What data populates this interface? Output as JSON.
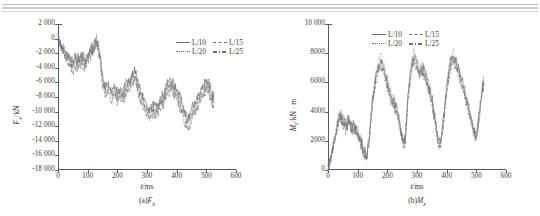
{
  "figure": {
    "panels": [
      {
        "id": "panel-a",
        "caption_prefix": "(a)",
        "caption_symbol": "F",
        "caption_sub": "x",
        "xlabel_var": "t",
        "xlabel_unit": "/ms",
        "ylabel_var": "F",
        "ylabel_sub": "x",
        "ylabel_unit": "/kN",
        "legend": [
          "L/10",
          "L/15",
          "L/20",
          "L/25"
        ]
      },
      {
        "id": "panel-b",
        "caption_prefix": "(b)",
        "caption_symbol": "M",
        "caption_sub": "z",
        "xlabel_var": "t",
        "xlabel_unit": "/ms",
        "ylabel_var": "M",
        "ylabel_sub": "z",
        "ylabel_unit": "/kN · m",
        "legend": [
          "L/10",
          "L/15",
          "L/20",
          "L/25"
        ]
      }
    ]
  },
  "chart_data": [
    {
      "type": "line",
      "id": "panel-a",
      "title": "(a)Fx",
      "xlabel": "t/ms",
      "ylabel": "Fx/kN",
      "xlim": [
        0,
        600
      ],
      "ylim": [
        -18000,
        2000
      ],
      "xticks": [
        0,
        100,
        200,
        300,
        400,
        500,
        600
      ],
      "yticks": [
        2000,
        0,
        -2000,
        -4000,
        -6000,
        -8000,
        -10000,
        -12000,
        -14000,
        -16000,
        -18000
      ],
      "ytick_labels": [
        "2 000",
        "0",
        "-2 000",
        "-4 000",
        "-6 000",
        "-8 000",
        "-10 000",
        "-12 000",
        "-14 000",
        "-16 000",
        "-18 000"
      ],
      "xtick_labels": [
        "0",
        "100",
        "200",
        "300",
        "400",
        "500",
        "600"
      ],
      "grid": false,
      "legend": [
        "L/10",
        "L/15",
        "L/20",
        "L/25"
      ],
      "legend_position": "top-right",
      "x": [
        0,
        10,
        20,
        30,
        40,
        50,
        60,
        70,
        80,
        90,
        100,
        110,
        120,
        130,
        140,
        150,
        160,
        170,
        180,
        190,
        200,
        210,
        220,
        230,
        240,
        250,
        260,
        270,
        280,
        290,
        300,
        310,
        320,
        330,
        340,
        350,
        360,
        370,
        380,
        390,
        400,
        410,
        420,
        430,
        440,
        450,
        460,
        470,
        480,
        490,
        500,
        510,
        520,
        525
      ],
      "series": [
        {
          "name": "L/10",
          "style": "solid",
          "values": [
            0,
            -900,
            -1700,
            -2200,
            -2600,
            -3100,
            -2500,
            -3000,
            -2400,
            -2900,
            -2300,
            -1600,
            -900,
            -300,
            -1500,
            -5200,
            -6600,
            -6000,
            -7200,
            -6500,
            -7400,
            -6700,
            -7300,
            -6200,
            -5800,
            -5000,
            -4700,
            -6100,
            -7400,
            -8400,
            -9200,
            -9700,
            -9000,
            -9500,
            -8600,
            -8000,
            -7400,
            -6200,
            -5700,
            -6400,
            -7000,
            -7800,
            -8900,
            -10400,
            -11000,
            -9800,
            -9000,
            -8200,
            -7400,
            -6500,
            -5500,
            -6400,
            -8100,
            -7300
          ]
        },
        {
          "name": "L/15",
          "style": "dash",
          "values": [
            0,
            -800,
            -1500,
            -2400,
            -2900,
            -3400,
            -2800,
            -3300,
            -2600,
            -3100,
            -2500,
            -1800,
            -1100,
            -200,
            -1800,
            -5600,
            -7000,
            -6400,
            -7600,
            -6900,
            -7800,
            -7100,
            -7700,
            -6600,
            -6200,
            -5400,
            -4500,
            -6500,
            -7800,
            -8800,
            -9600,
            -10100,
            -9400,
            -9900,
            -9000,
            -8400,
            -7800,
            -6600,
            -6100,
            -6800,
            -7400,
            -8200,
            -9300,
            -10800,
            -11400,
            -10200,
            -9400,
            -8600,
            -7800,
            -6900,
            -5900,
            -6800,
            -8500,
            -7700
          ]
        },
        {
          "name": "L/20",
          "style": "dot",
          "values": [
            0,
            -1000,
            -1900,
            -2600,
            -3200,
            -3800,
            -3300,
            -3700,
            -3000,
            -3500,
            -2900,
            -2100,
            -1300,
            -500,
            -2000,
            -6000,
            -7400,
            -6800,
            -8000,
            -7300,
            -8200,
            -7500,
            -8100,
            -7000,
            -6600,
            -5800,
            -5000,
            -6900,
            -8200,
            -9200,
            -10000,
            -10600,
            -9800,
            -10300,
            -9400,
            -8800,
            -8200,
            -7000,
            -6500,
            -7200,
            -7800,
            -8700,
            -9800,
            -11300,
            -11900,
            -10600,
            -9800,
            -9000,
            -8200,
            -7300,
            -6300,
            -7200,
            -9000,
            -8100
          ]
        },
        {
          "name": "L/25",
          "style": "dashdot",
          "values": [
            0,
            -1100,
            -2100,
            -2900,
            -3600,
            -4300,
            -3700,
            -4100,
            -3400,
            -3900,
            -3300,
            -2400,
            -1500,
            -600,
            -2300,
            -6400,
            -7800,
            -7200,
            -8400,
            -7700,
            -8600,
            -7900,
            -8500,
            -7400,
            -7000,
            -6200,
            -5400,
            -7300,
            -8600,
            -9700,
            -10500,
            -11100,
            -10300,
            -10800,
            -9900,
            -9200,
            -8600,
            -7400,
            -6900,
            -7600,
            -8300,
            -9200,
            -10300,
            -11900,
            -12500,
            -11200,
            -10300,
            -9400,
            -8600,
            -7700,
            -6700,
            -7600,
            -9500,
            -8600
          ]
        }
      ]
    },
    {
      "type": "line",
      "id": "panel-b",
      "title": "(b)Mz",
      "xlabel": "t/ms",
      "ylabel": "Mz/kN · m",
      "xlim": [
        0,
        600
      ],
      "ylim": [
        0,
        10000
      ],
      "xticks": [
        0,
        100,
        200,
        300,
        400,
        500,
        600
      ],
      "yticks": [
        0,
        2000,
        4000,
        6000,
        8000,
        10000
      ],
      "ytick_labels": [
        "0",
        "2000",
        "4000",
        "6000",
        "8000",
        "10 000"
      ],
      "xtick_labels": [
        "0",
        "100",
        "200",
        "300",
        "400",
        "500",
        "600"
      ],
      "grid": false,
      "legend": [
        "L/10",
        "L/15",
        "L/20",
        "L/25"
      ],
      "legend_position": "top-left",
      "x": [
        0,
        10,
        20,
        30,
        40,
        50,
        60,
        70,
        80,
        90,
        100,
        110,
        120,
        130,
        140,
        150,
        160,
        170,
        180,
        190,
        200,
        210,
        220,
        230,
        240,
        250,
        260,
        270,
        280,
        290,
        300,
        310,
        320,
        330,
        340,
        350,
        360,
        370,
        380,
        390,
        400,
        410,
        420,
        430,
        440,
        450,
        460,
        470,
        480,
        490,
        500,
        510,
        520,
        525
      ],
      "series": [
        {
          "name": "L/10",
          "style": "solid",
          "values": [
            100,
            900,
            1900,
            3000,
            3900,
            3500,
            3100,
            3400,
            2900,
            3100,
            2500,
            2000,
            1400,
            900,
            2500,
            4800,
            6300,
            7200,
            7600,
            6800,
            6000,
            5200,
            4700,
            4300,
            3500,
            2200,
            1900,
            5200,
            7000,
            7800,
            7300,
            6700,
            7100,
            6400,
            5800,
            4900,
            3600,
            2000,
            1900,
            3600,
            5600,
            7200,
            7900,
            7500,
            6900,
            6100,
            5400,
            4600,
            3700,
            2800,
            2400,
            3800,
            5600,
            6200
          ]
        },
        {
          "name": "L/15",
          "style": "dash",
          "values": [
            80,
            850,
            1800,
            2850,
            3700,
            3300,
            2950,
            3250,
            2750,
            2950,
            2350,
            1850,
            1300,
            800,
            2350,
            4600,
            6050,
            6950,
            7350,
            6550,
            5800,
            5000,
            4500,
            4100,
            3300,
            2050,
            1800,
            5000,
            6800,
            7550,
            7050,
            6450,
            6850,
            6150,
            5550,
            4700,
            3450,
            1900,
            1800,
            3450,
            5400,
            6950,
            7650,
            7250,
            6650,
            5900,
            5200,
            4450,
            3550,
            2700,
            2300,
            3650,
            5400,
            6000
          ]
        },
        {
          "name": "L/20",
          "style": "dot",
          "values": [
            90,
            950,
            2000,
            3150,
            4050,
            3650,
            3250,
            3550,
            3050,
            3250,
            2650,
            2100,
            1500,
            950,
            2650,
            5000,
            6500,
            7450,
            7850,
            7000,
            6200,
            5400,
            4900,
            4450,
            3650,
            2300,
            2000,
            5400,
            7200,
            8050,
            7500,
            6900,
            7300,
            6600,
            6000,
            5050,
            3750,
            2100,
            2000,
            3750,
            5800,
            7450,
            8150,
            7750,
            7100,
            6300,
            5600,
            4800,
            3850,
            2900,
            2500,
            3950,
            5800,
            6450
          ]
        },
        {
          "name": "L/25",
          "style": "dashdot",
          "values": [
            70,
            800,
            1750,
            2800,
            3600,
            3200,
            2850,
            3150,
            2650,
            2850,
            2250,
            1750,
            1200,
            750,
            2250,
            4500,
            5900,
            6800,
            7200,
            6400,
            5650,
            4900,
            4400,
            4000,
            3200,
            1950,
            1700,
            4850,
            6600,
            7400,
            6900,
            6300,
            6700,
            6000,
            5400,
            4550,
            3300,
            1800,
            1700,
            3300,
            5250,
            6800,
            7500,
            7100,
            6500,
            5750,
            5050,
            4300,
            3450,
            2600,
            2200,
            3550,
            5250,
            5850
          ]
        }
      ]
    }
  ]
}
